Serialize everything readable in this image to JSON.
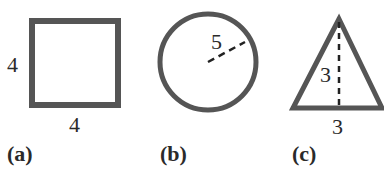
{
  "figures": [
    {
      "id": "a",
      "shape": "square",
      "caption": "(a)",
      "side_label_left": "4",
      "side_label_bottom": "4"
    },
    {
      "id": "b",
      "shape": "circle",
      "caption": "(b)",
      "radius_label": "5"
    },
    {
      "id": "c",
      "shape": "triangle",
      "caption": "(c)",
      "height_label": "3",
      "base_label": "3"
    }
  ],
  "colors": {
    "stroke": "#555555",
    "text": "#2a2a2a"
  }
}
